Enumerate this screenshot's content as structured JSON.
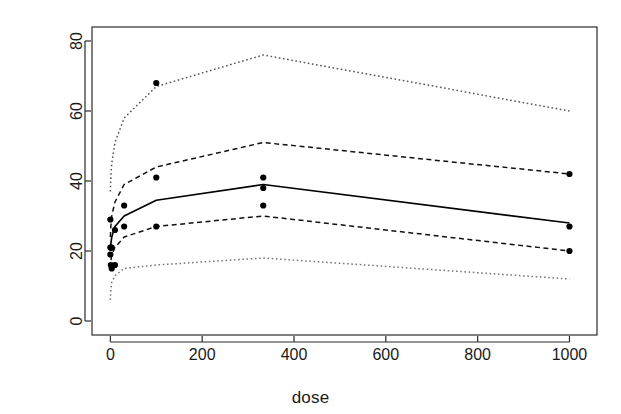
{
  "chart_data": {
    "type": "scatter",
    "title": "",
    "xlabel": "dose",
    "ylabel": "no. of colonies",
    "xlim": [
      -40,
      1060
    ],
    "ylim": [
      -4,
      84
    ],
    "grid": false,
    "legend": "none",
    "xticks": [
      0,
      200,
      400,
      600,
      800,
      1000
    ],
    "xtick_labels": [
      "0",
      "200",
      "400",
      "600",
      "800",
      "1000"
    ],
    "yticks": [
      0,
      20,
      40,
      60,
      80
    ],
    "ytick_labels": [
      "0",
      "20",
      "40",
      "60",
      "80"
    ],
    "points": {
      "name": "observed colonies",
      "marker": "filled-circle",
      "color": "#000000",
      "x": [
        0,
        0,
        0,
        1,
        1,
        3,
        3,
        10,
        10,
        30,
        30,
        100,
        100,
        100,
        333,
        333,
        333,
        1000,
        1000,
        1000
      ],
      "y": [
        29,
        21,
        19,
        21,
        16,
        21,
        15,
        26,
        16,
        33,
        27,
        68,
        41,
        27,
        41,
        38,
        33,
        42,
        27,
        20
      ]
    },
    "series": [
      {
        "name": "upper outer band",
        "style": "dotted",
        "color": "#555555",
        "x": [
          0,
          1,
          3,
          10,
          30,
          100,
          333,
          1000
        ],
        "y": [
          37,
          41,
          45,
          51,
          58,
          67,
          76,
          60
        ]
      },
      {
        "name": "upper inner band",
        "style": "dashed",
        "color": "#111111",
        "x": [
          0,
          1,
          3,
          10,
          30,
          100,
          333,
          1000
        ],
        "y": [
          24,
          27,
          30,
          34,
          39,
          44,
          51,
          42
        ]
      },
      {
        "name": "median fit",
        "style": "solid",
        "color": "#000000",
        "x": [
          0,
          1,
          3,
          10,
          30,
          100,
          333,
          1000
        ],
        "y": [
          20,
          22,
          24,
          27,
          30,
          34.5,
          39,
          28
        ]
      },
      {
        "name": "lower inner band",
        "style": "dashed",
        "color": "#111111",
        "x": [
          0,
          1,
          3,
          10,
          30,
          100,
          333,
          1000
        ],
        "y": [
          15,
          17,
          19,
          21,
          24,
          27,
          30,
          20
        ]
      },
      {
        "name": "lower outer band",
        "style": "dotted",
        "color": "#777777",
        "x": [
          0,
          1,
          3,
          10,
          30,
          100,
          333,
          1000
        ],
        "y": [
          6,
          9,
          11,
          13,
          15,
          16,
          18,
          12
        ]
      }
    ]
  },
  "axes": {
    "x_axis_label": "dose",
    "y_axis_label": "no. of colonies"
  }
}
